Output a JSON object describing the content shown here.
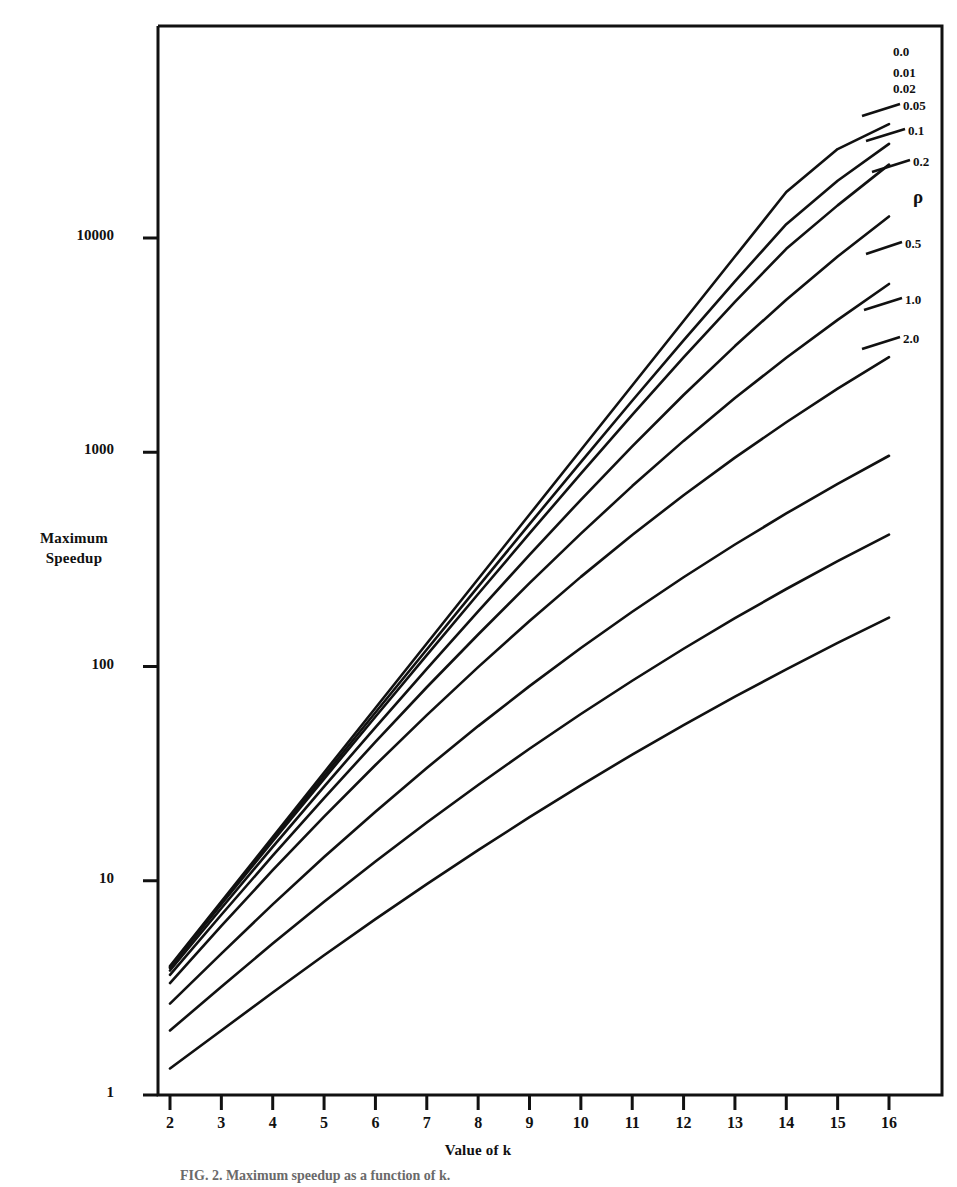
{
  "figure": {
    "caption": "FIG. 2.  Maximum speedup as a function of k."
  },
  "chart_data": {
    "type": "line",
    "title": "",
    "xlabel": "Value of k",
    "ylabel": "Maximum\nSpeedup",
    "ylabel_line1": "Maximum",
    "ylabel_line2": "Speedup",
    "xscale": "linear",
    "yscale": "log",
    "xlim": [
      2,
      16
    ],
    "ylim": [
      1,
      40000
    ],
    "grid": false,
    "legend_position": "right-inline-curve-labels",
    "legend_title": "ρ",
    "xticks": [
      2,
      3,
      4,
      5,
      6,
      7,
      8,
      9,
      10,
      11,
      12,
      13,
      14,
      15,
      16
    ],
    "xtick_labels": [
      "2",
      "3",
      "4",
      "5",
      "6",
      "7",
      "8",
      "9",
      "10",
      "11",
      "12",
      "13",
      "14",
      "15",
      "16"
    ],
    "yticks": [
      1,
      10,
      100,
      1000,
      10000
    ],
    "ytick_labels": [
      "1",
      "10",
      "100",
      "1000",
      "10000"
    ],
    "x": [
      2,
      3,
      4,
      5,
      6,
      7,
      8,
      9,
      10,
      11,
      12,
      13,
      14,
      15,
      16
    ],
    "series": [
      {
        "name": "0.0",
        "label": "0.0",
        "values": [
          4.0,
          8.0,
          16.0,
          32.0,
          64.0,
          128.0,
          256.0,
          512.0,
          1024.0,
          2048.0,
          4096.0,
          8192.0,
          16384.0,
          26000.0,
          34000.0
        ]
      },
      {
        "name": "0.01",
        "label": "0.01",
        "values": [
          3.96,
          7.88,
          15.6,
          30.9,
          61.0,
          120.0,
          236.0,
          462.0,
          900.0,
          1740.0,
          3330.0,
          6280.0,
          11600.0,
          18500.0,
          27500.0
        ]
      },
      {
        "name": "0.02",
        "label": "0.02",
        "values": [
          3.92,
          7.77,
          15.3,
          29.9,
          58.3,
          113.0,
          218.0,
          418.0,
          795.0,
          1495.0,
          2770.0,
          5030.0,
          8900.0,
          14200.0,
          22000.0
        ]
      },
      {
        "name": "0.05",
        "label": "0.05",
        "values": [
          3.81,
          7.44,
          14.4,
          27.5,
          52.0,
          97.5,
          181.0,
          332.0,
          600.0,
          1065.0,
          1850.0,
          3130.0,
          5150.0,
          8200.0,
          12600.0
        ]
      },
      {
        "name": "0.1",
        "label": "0.1",
        "values": [
          3.64,
          6.94,
          13.1,
          24.3,
          44.5,
          80.0,
          141.0,
          245.0,
          417.0,
          695.0,
          1130.0,
          1790.0,
          2760.0,
          4150.0,
          6100.0
        ]
      },
      {
        "name": "0.2",
        "label": "0.2",
        "values": [
          3.33,
          6.15,
          11.2,
          19.9,
          34.7,
          59.3,
          99.3,
          163.0,
          262.0,
          411.0,
          630.0,
          944.0,
          1380.0,
          1980.0,
          2780.0
        ]
      },
      {
        "name": "0.5",
        "label": "0.5",
        "values": [
          2.67,
          4.57,
          7.76,
          12.9,
          21.0,
          33.6,
          52.7,
          81.0,
          122.0,
          180.0,
          261.0,
          371.0,
          518.0,
          712.0,
          963.0
        ]
      },
      {
        "name": "1.0",
        "label": "1.0",
        "values": [
          2.0,
          3.2,
          5.09,
          7.97,
          12.3,
          18.7,
          28.0,
          41.3,
          60.0,
          85.8,
          121.0,
          168.0,
          230.0,
          310.0,
          413.0
        ]
      },
      {
        "name": "2.0",
        "label": "2.0",
        "values": [
          1.33,
          2.0,
          3.01,
          4.49,
          6.62,
          9.65,
          13.9,
          19.8,
          27.9,
          38.8,
          53.3,
          72.3,
          97.0,
          129.0,
          169.0
        ]
      }
    ],
    "annotations": [
      {
        "text": "0.0",
        "series": "0.0"
      },
      {
        "text": "0.01",
        "series": "0.01"
      },
      {
        "text": "0.02",
        "series": "0.02"
      },
      {
        "text": "0.05",
        "series": "0.05"
      },
      {
        "text": "0.1",
        "series": "0.1"
      },
      {
        "text": "0.2",
        "series": "0.2"
      },
      {
        "text": "ρ",
        "series": null
      },
      {
        "text": "0.5",
        "series": "0.5"
      },
      {
        "text": "1.0",
        "series": "1.0"
      },
      {
        "text": "2.0",
        "series": "2.0"
      }
    ]
  }
}
